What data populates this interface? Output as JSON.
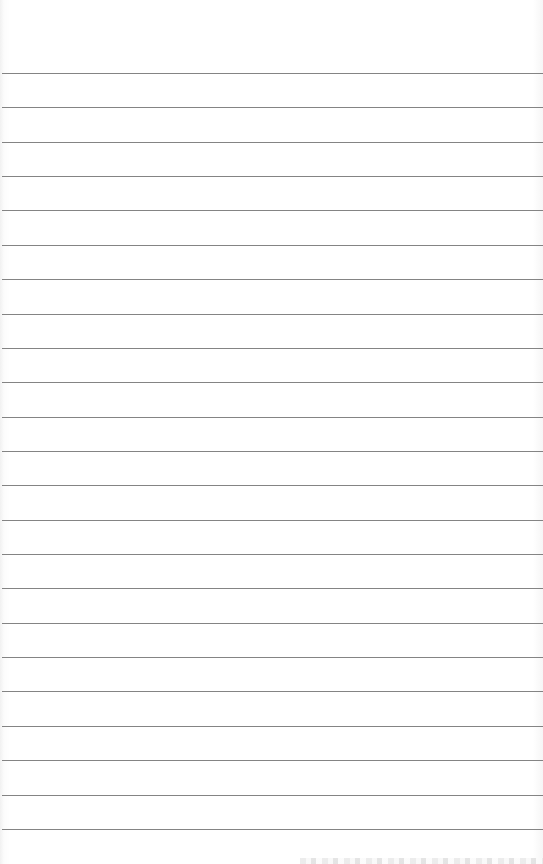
{
  "page": {
    "type": "lined-paper",
    "background_color": "#fdfdfd",
    "rule_color": "#6f6f6f",
    "rule_count": 23,
    "first_rule_y": 73,
    "rule_spacing": 34.36,
    "text": ""
  }
}
